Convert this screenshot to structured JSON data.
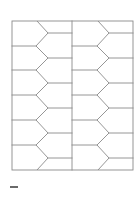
{
  "page": {
    "background": "#ffffff",
    "width": 138,
    "height": 199
  },
  "diagram": {
    "type": "tessellation-grid",
    "stroke_color": "#8a8a8a",
    "stroke_width": 0.9,
    "outer_frame": {
      "x": 12,
      "y": 21,
      "width": 121,
      "height": 149
    },
    "column_divider_x": 72,
    "columns": [
      {
        "x_left": 12,
        "x_right": 72,
        "zigzag_left_x": 36,
        "zigzag_right_x": 48
      },
      {
        "x_left": 72,
        "x_right": 133,
        "zigzag_left_x": 97,
        "zigzag_right_x": 109
      }
    ],
    "left_horizontals_y": [
      46,
      70,
      95,
      120,
      145
    ],
    "right_horizontals_y": [
      33,
      58,
      83,
      108,
      133,
      158
    ],
    "cell_count_per_column": 12,
    "total_cells": 24
  },
  "caption": {
    "text": "",
    "visible_as": "tiny illegible label mark"
  }
}
